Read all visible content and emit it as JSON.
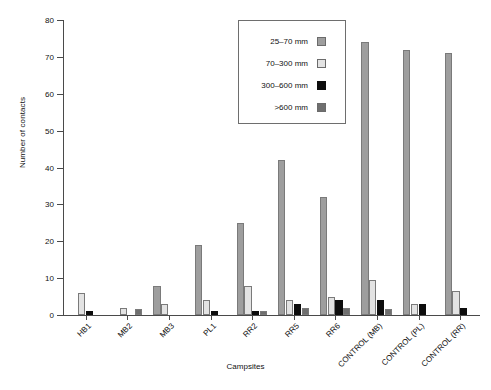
{
  "chart_data": {
    "type": "bar",
    "title": "",
    "xlabel": "Campsites",
    "ylabel": "Number of contacts",
    "ylim": [
      0,
      80
    ],
    "yticks": [
      0,
      10,
      20,
      30,
      40,
      50,
      60,
      70,
      80
    ],
    "grid": false,
    "legend_position": "upper-center",
    "categories": [
      "HB1",
      "MB2",
      "MB3",
      "PL1",
      "RR2",
      "RR5",
      "RR6",
      "CONTROL (MB)",
      "CONTROL (PL)",
      "CONTROL (RR)"
    ],
    "series": [
      {
        "name": "25–70 mm",
        "color": "#9e9e9e",
        "values": [
          0,
          0,
          8,
          19,
          25,
          42,
          32,
          74,
          72,
          71
        ]
      },
      {
        "name": "70–300 mm",
        "color": "#e3e3e3",
        "values": [
          6,
          2,
          3,
          4,
          8,
          4,
          5,
          9.5,
          3,
          6.5
        ]
      },
      {
        "name": "300–600 mm",
        "color": "#0d0d0d",
        "values": [
          1,
          0,
          0,
          1,
          1,
          3,
          4,
          4,
          3,
          2
        ]
      },
      {
        "name": ">600 mm",
        "color": "#6f6f6f",
        "values": [
          0,
          1.5,
          0,
          0,
          1,
          2,
          2,
          1.5,
          0,
          0
        ]
      }
    ]
  },
  "axis": {
    "y_title": "Number of contacts",
    "x_title": "Campsites",
    "y_tick_labels": [
      "0",
      "10",
      "20",
      "30",
      "40",
      "50",
      "60",
      "70",
      "80"
    ],
    "x_tick_labels": [
      "HB1",
      "MB2",
      "MB3",
      "PL1",
      "RR2",
      "RR5",
      "RR6",
      "CONTROL (MB)",
      "CONTROL (PL)",
      "CONTROL (RR)"
    ]
  },
  "legend": {
    "entries": [
      {
        "label": "25–70 mm",
        "color": "#9e9e9e"
      },
      {
        "label": "70–300 mm",
        "color": "#e3e3e3"
      },
      {
        "label": "300–600 mm",
        "color": "#0d0d0d"
      },
      {
        "label": ">600 mm",
        "color": "#6f6f6f"
      }
    ]
  }
}
